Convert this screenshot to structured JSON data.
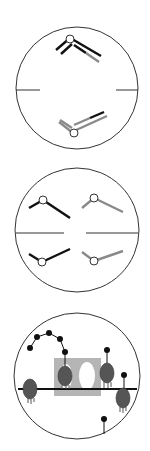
{
  "colors": {
    "black": "#111111",
    "gray": "#8a8a8a",
    "outline": "#333333",
    "protein": "#555555",
    "box": "#b5b5b5",
    "white": "#ffffff"
  },
  "panels": [
    {
      "id": "panel-1",
      "label": "bivalent-pair",
      "circle": {
        "cx": 77,
        "cy": 88,
        "r": 61
      }
    },
    {
      "id": "panel-2",
      "label": "four-chromatids",
      "circle": {
        "cx": 77,
        "cy": 230,
        "r": 62
      }
    },
    {
      "id": "panel-3",
      "label": "membrane-proteins",
      "circle": {
        "cx": 77,
        "cy": 376,
        "r": 63
      }
    }
  ]
}
